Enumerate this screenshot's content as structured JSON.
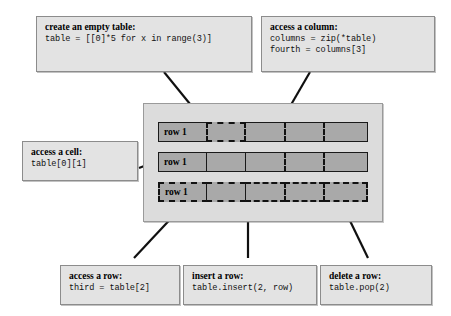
{
  "diagram": {
    "colors": {
      "callout_bg": "#e3e3e3",
      "callout_border": "#8c8c8c",
      "panel_bg": "#dcdcdc",
      "cell_fill": "#a9a9a9",
      "cell_border": "#1a1a1a",
      "line": "#101010"
    }
  },
  "callouts": {
    "create_table": {
      "title": "create an empty table:",
      "code": "table = [[0]*5 for x in range(3)]"
    },
    "access_column": {
      "title": "access a column:",
      "code_line_1": "columns = zip(*table)",
      "code_line_2": "fourth = columns[3]"
    },
    "access_cell": {
      "title": "access a cell:",
      "code": "table[0][1]"
    },
    "access_row": {
      "title": "access a row:",
      "code": "third = table[2]"
    },
    "insert_row": {
      "title": "insert a row:",
      "code": "table.insert(2, row)"
    },
    "delete_row": {
      "title": "delete a row:",
      "code": "table.pop(2)"
    }
  },
  "table": {
    "rows": [
      {
        "label": "row 1",
        "cells": [
          "row 1",
          "",
          "",
          "",
          ""
        ]
      },
      {
        "label": "row 1",
        "cells": [
          "row 1",
          "",
          "",
          "",
          ""
        ]
      },
      {
        "label": "row 1",
        "cells": [
          "row 1",
          "",
          "",
          "",
          ""
        ]
      }
    ],
    "row_count": 3,
    "column_count": 5,
    "highlighted_cell": {
      "row": 0,
      "column": 1
    },
    "highlighted_column": 3,
    "highlighted_row": 2
  }
}
